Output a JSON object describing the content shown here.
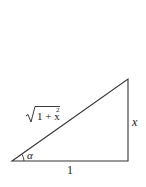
{
  "diagram": {
    "type": "right-triangle",
    "labels": {
      "hypotenuse_radicand": "1 + x",
      "hypotenuse_exponent": "2",
      "vertical_leg": "x",
      "horizontal_leg": "1",
      "angle": "α"
    },
    "colors": {
      "stroke": "#333333",
      "text": "#222222",
      "background": "#ffffff"
    }
  }
}
